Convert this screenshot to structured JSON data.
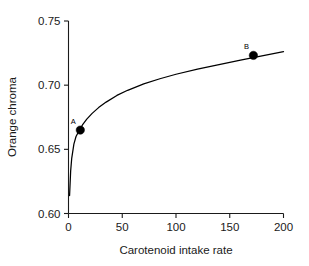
{
  "chart_data": {
    "type": "line",
    "title": "",
    "xlabel": "Carotenoid intake rate",
    "ylabel": "Orange chroma",
    "xlim": [
      0,
      200
    ],
    "ylim": [
      0.6,
      0.75
    ],
    "xticks": [
      0,
      50,
      100,
      150,
      200
    ],
    "xtick_labels": [
      "0",
      "50",
      "100",
      "150",
      "200"
    ],
    "yticks": [
      0.6,
      0.65,
      0.7,
      0.75
    ],
    "ytick_labels": [
      "0.60",
      "0.65",
      "0.70",
      "0.75"
    ],
    "grid": false,
    "legend": false,
    "series": [
      {
        "name": "orange chroma response curve",
        "x": [
          1,
          2,
          3,
          5,
          7,
          10,
          13,
          17,
          22,
          28,
          35,
          45,
          55,
          70,
          85,
          100,
          120,
          140,
          160,
          180,
          200
        ],
        "y": [
          0.614,
          0.633,
          0.643,
          0.654,
          0.66,
          0.6648,
          0.669,
          0.6735,
          0.678,
          0.6825,
          0.6868,
          0.692,
          0.696,
          0.701,
          0.705,
          0.7085,
          0.7125,
          0.716,
          0.7195,
          0.7228,
          0.7262
        ]
      }
    ],
    "annotations": [
      {
        "label": "A",
        "x": 11,
        "y": 0.665,
        "marker": "filled-circle",
        "label_position": "above-left"
      },
      {
        "label": "B",
        "x": 172,
        "y": 0.7232,
        "marker": "filled-circle",
        "label_position": "above-left"
      }
    ]
  },
  "colors": {
    "curve": "#000000",
    "marker": "#000000",
    "axis": "#1a1a1a",
    "background": "#ffffff"
  }
}
